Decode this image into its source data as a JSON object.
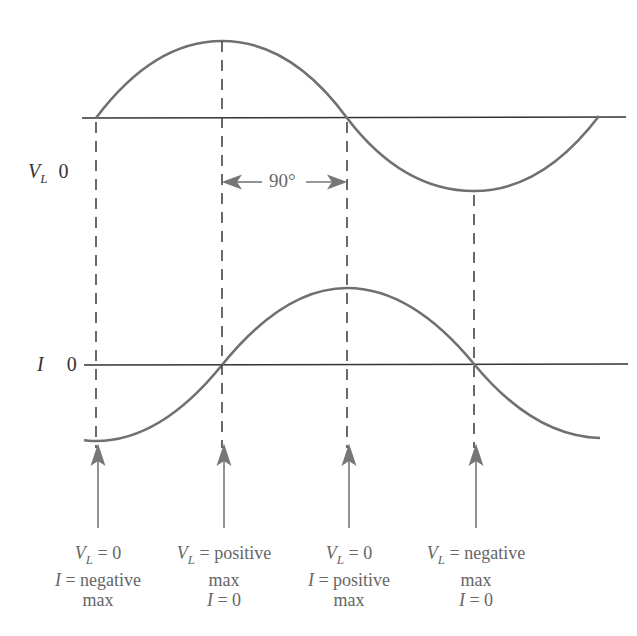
{
  "axes": {
    "voltage": {
      "symbol": "V",
      "subscript": "L",
      "zero_label": "0"
    },
    "current": {
      "symbol": "I",
      "subscript": "",
      "zero_label": "0"
    }
  },
  "phase_marker": {
    "label": "90°"
  },
  "annotations": [
    {
      "line1_sym": "V",
      "line1_sub": "L",
      "line1_rest": " = 0",
      "line2_sym": "I",
      "line2_rest": " = negative",
      "line3": "max",
      "line4": ""
    },
    {
      "line1_sym": "V",
      "line1_sub": "L",
      "line1_rest": " = positive",
      "line2_sym": "",
      "line2_rest": "max",
      "line3": "",
      "line3_sym": "I",
      "line3_rest": " = 0"
    },
    {
      "line1_sym": "V",
      "line1_sub": "L",
      "line1_rest": " = 0",
      "line2_sym": "I",
      "line2_rest": " = positive",
      "line3": "max"
    },
    {
      "line1_sym": "V",
      "line1_sub": "L",
      "line1_rest": " = negative",
      "line2_sym": "",
      "line2_rest": "max",
      "line3": "",
      "line3_sym": "I",
      "line3_rest": " = 0"
    }
  ],
  "colors": {
    "curve": "#707070",
    "axis": "#333333",
    "dash": "#444444",
    "arrow": "#777777"
  }
}
